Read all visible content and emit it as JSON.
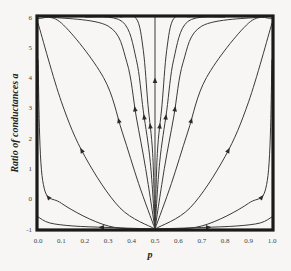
{
  "chart_data": {
    "type": "line",
    "title": "",
    "xlabel": "p",
    "ylabel": "Ratio of conductances a",
    "xlim": [
      0.0,
      1.0
    ],
    "ylim": [
      -1,
      6
    ],
    "xticks": [
      "0.0",
      "0.1",
      "0.2",
      "0.3",
      "0.4",
      "0.5",
      "0.6",
      "0.7",
      "0.8",
      "0.9",
      "1.0"
    ],
    "yticks": [
      "-1",
      "0",
      "1",
      "2",
      "3",
      "4",
      "5",
      "6"
    ],
    "grid": false,
    "legend": null,
    "series": [
      {
        "name": "flow-1",
        "points": [
          [
            0.5,
            -1
          ],
          [
            0.3,
            -0.95
          ],
          [
            0.15,
            -0.9
          ],
          [
            0.05,
            -0.8
          ],
          [
            0.0,
            -0.6
          ]
        ]
      },
      {
        "name": "flow-2",
        "points": [
          [
            0.5,
            -1
          ],
          [
            0.3,
            -0.9
          ],
          [
            0.1,
            -0.15
          ],
          [
            0.02,
            0.6
          ],
          [
            0.0,
            4.6
          ]
        ]
      },
      {
        "name": "flow-3",
        "points": [
          [
            0.5,
            -1
          ],
          [
            0.35,
            -0.3
          ],
          [
            0.2,
            1.4
          ],
          [
            0.1,
            3.2
          ],
          [
            0.0,
            5.8
          ]
        ]
      },
      {
        "name": "flow-4",
        "points": [
          [
            0.5,
            -1
          ],
          [
            0.43,
            0.5
          ],
          [
            0.36,
            2.2
          ],
          [
            0.28,
            4.0
          ],
          [
            0.1,
            5.8
          ],
          [
            0.0,
            5.95
          ]
        ]
      },
      {
        "name": "flow-5",
        "points": [
          [
            0.5,
            -1
          ],
          [
            0.46,
            1.0
          ],
          [
            0.42,
            2.7
          ],
          [
            0.38,
            4.5
          ],
          [
            0.3,
            5.7
          ],
          [
            0.05,
            6
          ]
        ]
      },
      {
        "name": "flow-6",
        "points": [
          [
            0.5,
            -1
          ],
          [
            0.48,
            1.2
          ],
          [
            0.45,
            2.9
          ],
          [
            0.42,
            4.6
          ],
          [
            0.36,
            5.85
          ],
          [
            0.2,
            6
          ]
        ]
      },
      {
        "name": "flow-7",
        "points": [
          [
            0.5,
            -1
          ],
          [
            0.49,
            1.5
          ],
          [
            0.47,
            3.1
          ],
          [
            0.45,
            4.9
          ],
          [
            0.42,
            5.95
          ],
          [
            0.35,
            6
          ]
        ]
      },
      {
        "name": "flow-8",
        "points": [
          [
            0.5,
            -1
          ],
          [
            0.5,
            6
          ]
        ]
      },
      {
        "name": "flow-9",
        "points": [
          [
            0.5,
            -1
          ],
          [
            0.51,
            1.5
          ],
          [
            0.53,
            3.1
          ],
          [
            0.55,
            4.9
          ],
          [
            0.58,
            5.95
          ],
          [
            0.65,
            6
          ]
        ]
      },
      {
        "name": "flow-10",
        "points": [
          [
            0.5,
            -1
          ],
          [
            0.52,
            1.2
          ],
          [
            0.55,
            2.9
          ],
          [
            0.58,
            4.6
          ],
          [
            0.64,
            5.85
          ],
          [
            0.8,
            6
          ]
        ]
      },
      {
        "name": "flow-11",
        "points": [
          [
            0.5,
            -1
          ],
          [
            0.54,
            1.0
          ],
          [
            0.58,
            2.7
          ],
          [
            0.62,
            4.5
          ],
          [
            0.7,
            5.7
          ],
          [
            0.95,
            6
          ]
        ]
      },
      {
        "name": "flow-12",
        "points": [
          [
            0.5,
            -1
          ],
          [
            0.57,
            0.5
          ],
          [
            0.64,
            2.2
          ],
          [
            0.72,
            4.0
          ],
          [
            0.9,
            5.8
          ],
          [
            1.0,
            5.95
          ]
        ]
      },
      {
        "name": "flow-13",
        "points": [
          [
            0.5,
            -1
          ],
          [
            0.65,
            -0.3
          ],
          [
            0.8,
            1.4
          ],
          [
            0.9,
            3.2
          ],
          [
            1.0,
            5.8
          ]
        ]
      },
      {
        "name": "flow-14",
        "points": [
          [
            0.5,
            -1
          ],
          [
            0.7,
            -0.9
          ],
          [
            0.9,
            -0.15
          ],
          [
            0.98,
            0.6
          ],
          [
            1.0,
            4.6
          ]
        ]
      },
      {
        "name": "flow-15",
        "points": [
          [
            0.5,
            -1
          ],
          [
            0.7,
            -0.95
          ],
          [
            0.85,
            -0.9
          ],
          [
            0.95,
            -0.8
          ],
          [
            1.0,
            -0.6
          ]
        ]
      }
    ]
  }
}
